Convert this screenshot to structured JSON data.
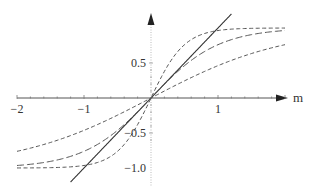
{
  "chart_data": {
    "type": "line",
    "title": "",
    "xlabel": "m",
    "ylabel": "",
    "xlim": [
      -2,
      2
    ],
    "ylim": [
      -1.2,
      1.2
    ],
    "grid": false,
    "legend": null,
    "x_ticks": [
      {
        "value": -2,
        "label": "−2"
      },
      {
        "value": -1,
        "label": "−1"
      },
      {
        "value": 1,
        "label": "1"
      }
    ],
    "y_ticks": [
      {
        "value": 0.5,
        "label": "0.5"
      },
      {
        "value": -0.5,
        "label": "−0.5"
      },
      {
        "value": -1.0,
        "label": "−1.0"
      }
    ],
    "series": [
      {
        "name": "y = m",
        "style": "solid",
        "formula": "m",
        "x": [
          -1.2,
          1.2
        ],
        "values": [
          -1.2,
          1.2
        ]
      },
      {
        "name": "tanh(2m)",
        "style": "dashed-short",
        "formula": "tanh(2m)",
        "x": [
          -2,
          -1.5,
          -1,
          -0.5,
          0,
          0.5,
          1,
          1.5,
          2
        ],
        "values": [
          -1.0,
          -0.99,
          -0.96,
          -0.76,
          0,
          0.76,
          0.96,
          0.99,
          1.0
        ]
      },
      {
        "name": "tanh(m)",
        "style": "dashed-long",
        "formula": "tanh(m)",
        "x": [
          -2,
          -1.5,
          -1,
          -0.5,
          0,
          0.5,
          1,
          1.5,
          2
        ],
        "values": [
          -0.96,
          -0.91,
          -0.76,
          -0.46,
          0,
          0.46,
          0.76,
          0.91,
          0.96
        ]
      },
      {
        "name": "tanh(m/2)",
        "style": "dashed-short",
        "formula": "tanh(m/2)",
        "x": [
          -2,
          -1.5,
          -1,
          -0.5,
          0,
          0.5,
          1,
          1.5,
          2
        ],
        "values": [
          -0.76,
          -0.64,
          -0.46,
          -0.24,
          0,
          0.24,
          0.46,
          0.64,
          0.76
        ]
      }
    ]
  },
  "axes": {
    "x_axis_label": "m"
  }
}
